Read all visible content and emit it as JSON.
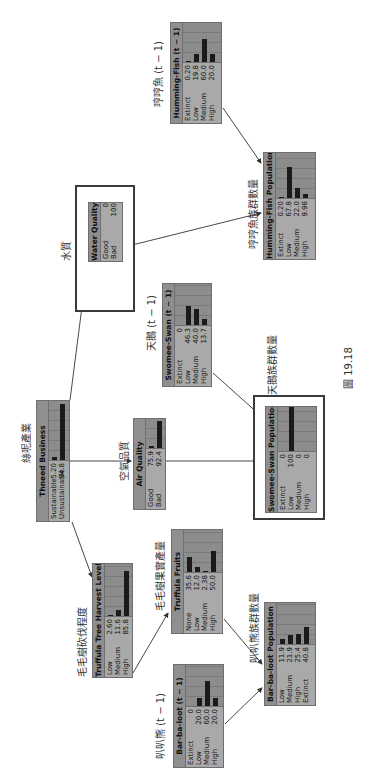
{
  "figure_caption": "圖 19.18",
  "nodes": {
    "humming_fish_prev": {
      "title": "Humming-Fish (t − 1)",
      "label_zh": "哼哼魚 (t − 1)",
      "states": [
        {
          "label": "Extinct",
          "value": "0.20",
          "pct": 0.2
        },
        {
          "label": "Low",
          "value": "19.8",
          "pct": 19.8
        },
        {
          "label": "Medium",
          "value": "60.0",
          "pct": 60.0
        },
        {
          "label": "High",
          "value": "20.0",
          "pct": 20.0
        }
      ]
    },
    "humming_fish_pop": {
      "title": "Humming-Fish Population",
      "label_zh": "哼哼魚族群數量",
      "states": [
        {
          "label": "Extinct",
          "value": "0.20",
          "pct": 0.2
        },
        {
          "label": "Low",
          "value": "67.8",
          "pct": 67.8
        },
        {
          "label": "Medium",
          "value": "22.0",
          "pct": 22.0
        },
        {
          "label": "High",
          "value": "9.98",
          "pct": 9.98
        }
      ]
    },
    "water_quality": {
      "title": "Water Quality",
      "label_zh": "水質",
      "states": [
        {
          "label": "Good",
          "value": "0",
          "pct": 0
        },
        {
          "label": "Bad",
          "value": "100",
          "pct": 100
        }
      ]
    },
    "thneed_business": {
      "title": "Thneed Business",
      "label_zh": "絲呢產業",
      "states": [
        {
          "label": "Sustainable",
          "value": "5.20",
          "pct": 5.2
        },
        {
          "label": "Unsustainable",
          "value": "94.8",
          "pct": 94.8
        }
      ]
    },
    "air_quality": {
      "title": "Air Quality",
      "label_zh": "空氣品質",
      "states": [
        {
          "label": "Good",
          "value": "75.9",
          "pct": 7.6
        },
        {
          "label": "Bad",
          "value": "92.4",
          "pct": 92.4
        }
      ]
    },
    "swomee_swan_prev": {
      "title": "Swomee-Swan (t − 1)",
      "label_zh": "天鵝 (t − 1)",
      "states": [
        {
          "label": "Extinct",
          "value": "0",
          "pct": 0
        },
        {
          "label": "Low",
          "value": "46.3",
          "pct": 46.3
        },
        {
          "label": "Medium",
          "value": "40.0",
          "pct": 40.0
        },
        {
          "label": "High",
          "value": "13.7",
          "pct": 13.7
        }
      ]
    },
    "swomee_swan_pop": {
      "title": "Swomee-Swan Population",
      "label_zh": "天鵝族群數量",
      "states": [
        {
          "label": "Extinct",
          "value": "0",
          "pct": 0
        },
        {
          "label": "Low",
          "value": "100",
          "pct": 100
        },
        {
          "label": "Medium",
          "value": "0",
          "pct": 0
        },
        {
          "label": "High",
          "value": "0",
          "pct": 0
        }
      ]
    },
    "truffula_harvest": {
      "title": "Truffula Tree Harvest Level",
      "label_zh": "毛毛樹砍伐程度",
      "states": [
        {
          "label": "Low",
          "value": "2.60",
          "pct": 2.6
        },
        {
          "label": "Medium",
          "value": "11.6",
          "pct": 11.6
        },
        {
          "label": "High",
          "value": "85.8",
          "pct": 85.8
        }
      ]
    },
    "truffula_fruits": {
      "title": "Truffula Fruits",
      "label_zh": "毛毛樹果實產量",
      "states": [
        {
          "label": "None",
          "value": "35.6",
          "pct": 35.6
        },
        {
          "label": "Low",
          "value": "12.0",
          "pct": 12.0
        },
        {
          "label": "Medium",
          "value": "2.38",
          "pct": 2.38
        },
        {
          "label": "High",
          "value": "50.0",
          "pct": 50.0
        }
      ]
    },
    "barbaloot_prev": {
      "title": "Bar-ba-loot (t − 1)",
      "label_zh": "叭叭熊 (t − 1)",
      "states": [
        {
          "label": "Extinct",
          "value": "0",
          "pct": 0
        },
        {
          "label": "Low",
          "value": "20.0",
          "pct": 20.0
        },
        {
          "label": "Medium",
          "value": "60.0",
          "pct": 60.0
        },
        {
          "label": "High",
          "value": "20.0",
          "pct": 20.0
        }
      ]
    },
    "barbaloot_pop": {
      "title": "Bar-ba-loot Population",
      "label_zh": "叭叭熊族群數量",
      "states": [
        {
          "label": "Low",
          "value": "11.9",
          "pct": 11.9
        },
        {
          "label": "Medium",
          "value": "21.9",
          "pct": 21.9
        },
        {
          "label": "High",
          "value": "25.4",
          "pct": 25.4
        },
        {
          "label": "Extinct",
          "value": "40.8",
          "pct": 40.8
        }
      ]
    }
  },
  "edges": [
    [
      "thneed_business",
      "water_quality"
    ],
    [
      "thneed_business",
      "air_quality"
    ],
    [
      "thneed_business",
      "truffula_harvest"
    ],
    [
      "water_quality",
      "humming_fish_pop"
    ],
    [
      "humming_fish_prev",
      "humming_fish_pop"
    ],
    [
      "air_quality",
      "swomee_swan_pop"
    ],
    [
      "swomee_swan_prev",
      "swomee_swan_pop"
    ],
    [
      "truffula_harvest",
      "truffula_fruits"
    ],
    [
      "truffula_fruits",
      "barbaloot_pop"
    ],
    [
      "barbaloot_prev",
      "barbaloot_pop"
    ]
  ]
}
